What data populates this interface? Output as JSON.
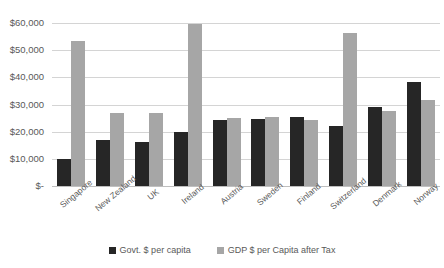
{
  "chart_data": {
    "type": "bar",
    "title": "",
    "subtitle": "",
    "xlabel": "",
    "ylabel": "",
    "ylim": [
      0,
      60000
    ],
    "ytick_values": [
      0,
      10000,
      20000,
      30000,
      40000,
      50000,
      60000
    ],
    "ytick_labels": [
      "$-",
      "$10,000",
      "$20,000",
      "$30,000",
      "$40,000",
      "$50,000",
      "$60,000"
    ],
    "grid": true,
    "legend_position": "bottom",
    "categories": [
      "Singapore",
      "New Zealand",
      "UK",
      "Ireland",
      "Austria",
      "Sweden",
      "Finland",
      "Switzerland",
      "Denmark",
      "Norway"
    ],
    "series": [
      {
        "name": "Govt. $ per capita",
        "color": "#262626",
        "values": [
          9800,
          16800,
          16300,
          20000,
          24200,
          24700,
          25500,
          22000,
          29200,
          38300
        ]
      },
      {
        "name": "GDP $ per Capita after Tax",
        "color": "#a6a6a6",
        "values": [
          53500,
          26700,
          26800,
          59500,
          25000,
          25300,
          24300,
          56500,
          27700,
          31600
        ]
      }
    ]
  }
}
